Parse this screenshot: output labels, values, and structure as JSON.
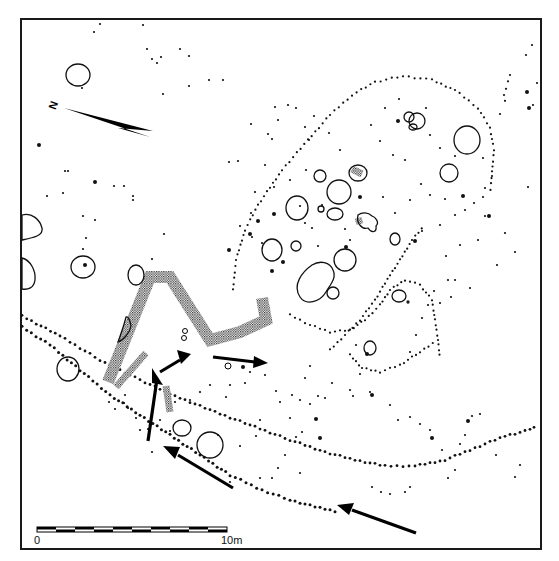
{
  "plan": {
    "frame": {
      "x": 21,
      "y": 19,
      "width": 520,
      "height": 530
    },
    "north_arrow": {
      "label": "N",
      "label_x": 49,
      "label_y": 109,
      "tip": [
        64,
        108
      ],
      "tail_a": [
        153,
        131
      ],
      "tail_b": [
        150,
        137
      ],
      "notch": [
        118,
        128
      ]
    },
    "scale_bar": {
      "x": 37,
      "y": 527,
      "width": 190,
      "height": 5,
      "segments": 10,
      "label_start": "0",
      "label_end": "10m",
      "label_start_x": 34,
      "label_end_x": 221,
      "label_y": 544
    },
    "pits": [
      {
        "cx": 78,
        "cy": 75,
        "rx": 12,
        "ry": 11
      },
      {
        "cx": 83,
        "cy": 267,
        "rx": 12,
        "ry": 11
      },
      {
        "cx": 136,
        "cy": 275,
        "rx": 8,
        "ry": 10
      },
      {
        "cx": 68,
        "cy": 369,
        "rx": 11,
        "ry": 12
      },
      {
        "cx": 182,
        "cy": 428,
        "rx": 9,
        "ry": 8
      },
      {
        "cx": 210,
        "cy": 445,
        "rx": 13,
        "ry": 13
      },
      {
        "cx": 297,
        "cy": 208,
        "rx": 11,
        "ry": 12
      },
      {
        "cx": 320,
        "cy": 176,
        "rx": 6,
        "ry": 6
      },
      {
        "cx": 339,
        "cy": 192,
        "rx": 12,
        "ry": 12
      },
      {
        "cx": 335,
        "cy": 214,
        "rx": 8,
        "ry": 6
      },
      {
        "cx": 358,
        "cy": 173,
        "rx": 9,
        "ry": 8
      },
      {
        "cx": 272,
        "cy": 250,
        "rx": 10,
        "ry": 11
      },
      {
        "cx": 296,
        "cy": 246,
        "rx": 5,
        "ry": 5
      },
      {
        "cx": 345,
        "cy": 260,
        "rx": 11,
        "ry": 11
      },
      {
        "cx": 333,
        "cy": 293,
        "rx": 6,
        "ry": 6
      },
      {
        "cx": 321,
        "cy": 209,
        "rx": 3,
        "ry": 3
      },
      {
        "cx": 395,
        "cy": 239,
        "rx": 5,
        "ry": 6
      },
      {
        "cx": 417,
        "cy": 121,
        "rx": 8,
        "ry": 8
      },
      {
        "cx": 409,
        "cy": 117,
        "rx": 5,
        "ry": 5
      },
      {
        "cx": 413,
        "cy": 127,
        "rx": 4,
        "ry": 3
      },
      {
        "cx": 467,
        "cy": 140,
        "rx": 13,
        "ry": 14
      },
      {
        "cx": 449,
        "cy": 173,
        "rx": 9,
        "ry": 9
      },
      {
        "cx": 399,
        "cy": 296,
        "rx": 7,
        "ry": 6
      },
      {
        "cx": 370,
        "cy": 348,
        "rx": 6,
        "ry": 7
      },
      {
        "cx": 408,
        "cy": 302,
        "rx": 1,
        "ry": 1
      }
    ],
    "irregular_pits": [
      {
        "d": "M300 297 C292 285 302 272 312 265 C320 260 330 262 333 270 C337 278 330 285 326 292 C320 302 306 306 300 297 Z"
      },
      {
        "d": "M358 215 C356 223 362 230 368 228 C372 234 377 232 376 226 C380 222 375 217 372 216 C368 212 362 212 358 215 Z"
      },
      {
        "d": "M22 215 L22 240 C32 238 44 236 42 228 C40 220 32 212 22 215 Z"
      },
      {
        "d": "M22 258 C30 260 36 270 35 280 C34 288 28 290 22 289 Z"
      },
      {
        "d": "M126 317 C124 326 120 336 118 342 C124 340 130 332 131 326 C130 320 128 316 126 317 Z"
      }
    ],
    "stippled_features": [
      {
        "name": "trench-main",
        "points": "108,382 150,277 170,277 210,340 240,332 266,320 262,298"
      },
      {
        "name": "trench-branch",
        "points": "116,387 146,353"
      },
      {
        "name": "trench-short",
        "points": "166,386 170,412"
      },
      {
        "name": "stipple-small-1",
        "points": "352,169 362,174"
      },
      {
        "name": "stipple-small-2",
        "points": "358,218 360,224"
      }
    ],
    "small_rings": [
      {
        "cx": 185,
        "cy": 331,
        "r": 2.5
      },
      {
        "cx": 184,
        "cy": 338,
        "r": 2.5
      },
      {
        "cx": 228,
        "cy": 366,
        "r": 3
      }
    ],
    "arrows": [
      {
        "name": "arrow-up-left",
        "shaft": [
          148,
          441,
          157,
          379
        ],
        "head": "152,368 163,385 152,383"
      },
      {
        "name": "arrow-up-right",
        "shaft": [
          160,
          372,
          180,
          360
        ],
        "head": "191,354 177,350 181,364"
      },
      {
        "name": "arrow-east",
        "shaft": [
          213,
          357,
          255,
          362
        ],
        "head": "268,363 254,356 253,368"
      },
      {
        "name": "arrow-mid",
        "shaft": [
          233,
          488,
          178,
          455
        ],
        "head": "163,446 180,447 175,459"
      },
      {
        "name": "arrow-low",
        "shaft": [
          416,
          533,
          352,
          510
        ],
        "head": "337,505 354,503 349,515"
      }
    ],
    "dot_lines": [
      {
        "name": "palisade-outer-upper",
        "points": [
          [
            22,
            316
          ],
          [
            60,
            336
          ],
          [
            100,
            360
          ],
          [
            140,
            380
          ],
          [
            180,
            398
          ],
          [
            215,
            412
          ],
          [
            250,
            425
          ],
          [
            290,
            440
          ],
          [
            325,
            452
          ],
          [
            355,
            460
          ],
          [
            385,
            466
          ],
          [
            415,
            466
          ],
          [
            445,
            460
          ],
          [
            475,
            448
          ],
          [
            505,
            436
          ],
          [
            530,
            430
          ],
          [
            538,
            424
          ]
        ],
        "step": 5.5,
        "r": 1.4
      },
      {
        "name": "palisade-outer-lower",
        "points": [
          [
            22,
            327
          ],
          [
            50,
            345
          ],
          [
            80,
            370
          ],
          [
            110,
            395
          ],
          [
            140,
            415
          ],
          [
            170,
            435
          ],
          [
            200,
            455
          ],
          [
            230,
            475
          ],
          [
            262,
            490
          ],
          [
            290,
            500
          ],
          [
            320,
            508
          ],
          [
            340,
            512
          ]
        ],
        "step": 5.5,
        "r": 1.5
      },
      {
        "name": "inner-enclosure-arc",
        "points": [
          [
            233,
            290
          ],
          [
            236,
            260
          ],
          [
            245,
            230
          ],
          [
            258,
            205
          ],
          [
            282,
            170
          ],
          [
            308,
            140
          ],
          [
            330,
            115
          ],
          [
            352,
            95
          ],
          [
            375,
            82
          ],
          [
            403,
            76
          ],
          [
            432,
            80
          ],
          [
            455,
            90
          ],
          [
            478,
            108
          ],
          [
            490,
            128
          ],
          [
            494,
            150
          ],
          [
            492,
            172
          ],
          [
            490,
            195
          ]
        ],
        "step": 5.5,
        "r": 1.1
      },
      {
        "name": "inner-enclosure-lower",
        "points": [
          [
            290,
            315
          ],
          [
            310,
            325
          ],
          [
            330,
            332
          ],
          [
            350,
            330
          ],
          [
            365,
            320
          ],
          [
            380,
            305
          ],
          [
            390,
            290
          ],
          [
            405,
            280
          ],
          [
            420,
            285
          ],
          [
            432,
            300
          ],
          [
            435,
            320
          ],
          [
            438,
            340
          ],
          [
            440,
            360
          ]
        ],
        "step": 5.0,
        "r": 1.1
      },
      {
        "name": "inner-diagonal",
        "points": [
          [
            330,
            350
          ],
          [
            345,
            335
          ],
          [
            360,
            320
          ],
          [
            375,
            300
          ],
          [
            390,
            275
          ],
          [
            400,
            260
          ],
          [
            412,
            240
          ],
          [
            425,
            225
          ]
        ],
        "step": 5.0,
        "r": 1.1
      },
      {
        "name": "inner-low-arc",
        "points": [
          [
            350,
            355
          ],
          [
            362,
            368
          ],
          [
            380,
            372
          ],
          [
            400,
            365
          ],
          [
            420,
            352
          ],
          [
            437,
            340
          ]
        ],
        "step": 5.0,
        "r": 1.1
      },
      {
        "name": "top-right-cluster",
        "points": [
          [
            508,
            82
          ],
          [
            504,
            95
          ],
          [
            506,
            108
          ]
        ],
        "step": 5.5,
        "r": 1.1
      }
    ],
    "scatter_dots": [
      [
        100,
        24
      ],
      [
        94,
        32
      ],
      [
        143,
        25
      ],
      [
        147,
        49
      ],
      [
        152,
        59
      ],
      [
        157,
        63
      ],
      [
        161,
        57
      ],
      [
        180,
        49
      ],
      [
        189,
        56
      ],
      [
        209,
        80
      ],
      [
        223,
        80
      ],
      [
        189,
        86
      ],
      [
        163,
        94
      ],
      [
        82,
        88
      ],
      [
        251,
        124
      ],
      [
        229,
        162
      ],
      [
        238,
        161
      ],
      [
        265,
        165
      ],
      [
        65,
        171
      ],
      [
        68,
        171
      ],
      [
        124,
        186
      ],
      [
        114,
        186
      ],
      [
        133,
        200
      ],
      [
        133,
        196
      ],
      [
        47,
        196
      ],
      [
        63,
        193
      ],
      [
        83,
        216
      ],
      [
        95,
        220
      ],
      [
        86,
        238
      ],
      [
        164,
        234
      ],
      [
        152,
        259
      ],
      [
        83,
        249
      ],
      [
        251,
        213
      ],
      [
        268,
        134
      ],
      [
        275,
        107
      ],
      [
        288,
        105
      ],
      [
        305,
        127
      ],
      [
        309,
        140
      ],
      [
        278,
        120
      ],
      [
        272,
        139
      ],
      [
        296,
        108
      ],
      [
        314,
        116
      ],
      [
        329,
        133
      ],
      [
        340,
        150
      ],
      [
        306,
        170
      ],
      [
        290,
        180
      ],
      [
        274,
        187
      ],
      [
        255,
        192
      ],
      [
        262,
        243
      ],
      [
        240,
        226
      ],
      [
        252,
        237
      ],
      [
        300,
        206
      ],
      [
        305,
        223
      ],
      [
        312,
        228
      ],
      [
        318,
        246
      ],
      [
        322,
        205
      ],
      [
        345,
        229
      ],
      [
        350,
        240
      ],
      [
        383,
        197
      ],
      [
        395,
        213
      ],
      [
        410,
        200
      ],
      [
        421,
        184
      ],
      [
        405,
        160
      ],
      [
        393,
        155
      ],
      [
        380,
        141
      ],
      [
        371,
        125
      ],
      [
        385,
        108
      ],
      [
        399,
        99
      ],
      [
        426,
        108
      ],
      [
        430,
        135
      ],
      [
        440,
        148
      ],
      [
        455,
        156
      ],
      [
        483,
        158
      ],
      [
        492,
        176
      ],
      [
        485,
        188
      ],
      [
        483,
        197
      ],
      [
        474,
        203
      ],
      [
        465,
        210
      ],
      [
        455,
        215
      ],
      [
        440,
        225
      ],
      [
        422,
        231
      ],
      [
        430,
        195
      ],
      [
        445,
        199
      ],
      [
        500,
        114
      ],
      [
        510,
        75
      ],
      [
        537,
        83
      ],
      [
        533,
        105
      ],
      [
        526,
        55
      ],
      [
        532,
        45
      ],
      [
        528,
        187
      ],
      [
        505,
        233
      ],
      [
        515,
        252
      ],
      [
        497,
        265
      ],
      [
        478,
        240
      ],
      [
        485,
        216
      ],
      [
        460,
        245
      ],
      [
        446,
        256
      ],
      [
        448,
        280
      ],
      [
        434,
        291
      ],
      [
        428,
        305
      ],
      [
        422,
        318
      ],
      [
        416,
        335
      ],
      [
        410,
        352
      ],
      [
        440,
        303
      ],
      [
        451,
        297
      ],
      [
        455,
        280
      ],
      [
        470,
        288
      ],
      [
        350,
        390
      ],
      [
        360,
        374
      ],
      [
        390,
        405
      ],
      [
        398,
        420
      ],
      [
        410,
        417
      ],
      [
        420,
        424
      ],
      [
        430,
        430
      ],
      [
        442,
        450
      ],
      [
        460,
        444
      ],
      [
        472,
        416
      ],
      [
        480,
        414
      ],
      [
        496,
        455
      ],
      [
        515,
        477
      ],
      [
        353,
        396
      ],
      [
        356,
        345
      ],
      [
        370,
        392
      ],
      [
        200,
        392
      ],
      [
        210,
        385
      ],
      [
        226,
        397
      ],
      [
        230,
        385
      ],
      [
        245,
        383
      ],
      [
        250,
        372
      ],
      [
        265,
        375
      ],
      [
        276,
        391
      ],
      [
        280,
        402
      ],
      [
        292,
        395
      ],
      [
        300,
        400
      ],
      [
        310,
        404
      ],
      [
        318,
        396
      ],
      [
        325,
        398
      ],
      [
        332,
        383
      ],
      [
        305,
        378
      ],
      [
        310,
        366
      ],
      [
        290,
        418
      ],
      [
        302,
        432
      ],
      [
        296,
        437
      ],
      [
        260,
        420
      ],
      [
        256,
        436
      ],
      [
        240,
        446
      ],
      [
        218,
        435
      ],
      [
        190,
        400
      ],
      [
        175,
        402
      ],
      [
        148,
        429
      ],
      [
        152,
        452
      ],
      [
        170,
        431
      ],
      [
        160,
        420
      ],
      [
        136,
        418
      ],
      [
        140,
        430
      ],
      [
        128,
        408
      ],
      [
        124,
        403
      ],
      [
        125,
        395
      ],
      [
        115,
        409
      ],
      [
        109,
        402
      ],
      [
        260,
        478
      ],
      [
        272,
        478
      ],
      [
        278,
        468
      ],
      [
        230,
        482
      ],
      [
        285,
        455
      ],
      [
        300,
        473
      ],
      [
        410,
        487
      ],
      [
        448,
        478
      ],
      [
        455,
        470
      ],
      [
        465,
        435
      ],
      [
        520,
        465
      ],
      [
        372,
        487
      ],
      [
        381,
        492
      ],
      [
        390,
        494
      ],
      [
        405,
        492
      ]
    ],
    "heavy_dots": [
      [
        39,
        145
      ],
      [
        95,
        182
      ],
      [
        85,
        265
      ],
      [
        123,
        380
      ],
      [
        229,
        250
      ],
      [
        272,
        271
      ],
      [
        274,
        214
      ],
      [
        415,
        241
      ],
      [
        463,
        196
      ],
      [
        529,
        108
      ],
      [
        527,
        92
      ],
      [
        346,
        247
      ],
      [
        360,
        197
      ],
      [
        398,
        121
      ],
      [
        372,
        395
      ],
      [
        367,
        354
      ],
      [
        316,
        419
      ],
      [
        320,
        438
      ],
      [
        243,
        367
      ],
      [
        283,
        262
      ],
      [
        258,
        221
      ],
      [
        250,
        234
      ],
      [
        489,
        216
      ],
      [
        468,
        421
      ],
      [
        432,
        438
      ]
    ]
  }
}
